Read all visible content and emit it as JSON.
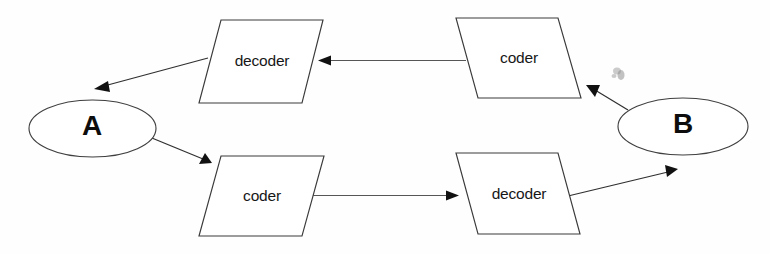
{
  "diagram": {
    "background_color": "#ffffff",
    "stroke_color": "#2f2f2f",
    "text_color": "#171717",
    "nodes": [
      {
        "id": "decoder_top",
        "label": "decoder",
        "shape": "parallelogram",
        "position": "top-left"
      },
      {
        "id": "coder_top",
        "label": "coder",
        "shape": "parallelogram",
        "position": "top-right"
      },
      {
        "id": "coder_bottom",
        "label": "coder",
        "shape": "parallelogram",
        "position": "bottom-left"
      },
      {
        "id": "decoder_bottom",
        "label": "decoder",
        "shape": "parallelogram",
        "position": "bottom-right"
      }
    ],
    "endpoints": [
      {
        "id": "endpoint_a",
        "label": "A",
        "shape": "ellipse",
        "position": "left"
      },
      {
        "id": "endpoint_b",
        "label": "B",
        "shape": "ellipse",
        "position": "right"
      }
    ],
    "edges": [
      {
        "id": "edge_coder_top_to_decoder_top",
        "from": "coder_top",
        "to": "decoder_top",
        "direction": "left"
      },
      {
        "id": "edge_decoder_top_to_a",
        "from": "decoder_top",
        "to": "endpoint_a",
        "direction": "down-left"
      },
      {
        "id": "edge_b_to_coder_top",
        "from": "endpoint_b",
        "to": "coder_top",
        "direction": "up-left"
      },
      {
        "id": "edge_a_to_coder_bottom",
        "from": "endpoint_a",
        "to": "coder_bottom",
        "direction": "down-right"
      },
      {
        "id": "edge_coder_bottom_to_decoder_bottom",
        "from": "coder_bottom",
        "to": "decoder_bottom",
        "direction": "right"
      },
      {
        "id": "edge_decoder_bottom_to_b",
        "from": "decoder_bottom",
        "to": "endpoint_b",
        "direction": "up-right"
      }
    ]
  }
}
